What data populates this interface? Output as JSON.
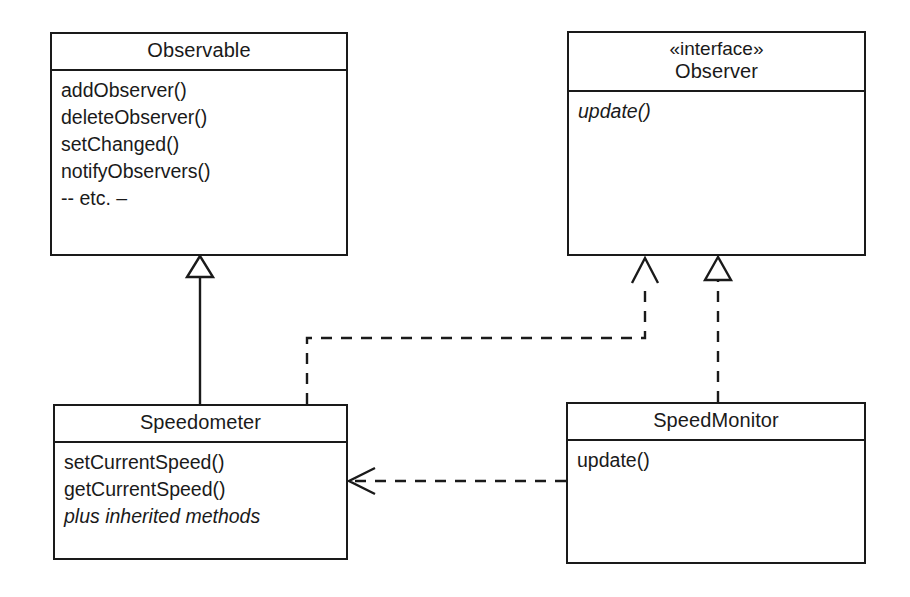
{
  "diagram": {
    "stroke_color": "#1a1a1a",
    "background_color": "#ffffff"
  },
  "classes": {
    "observable": {
      "name": "Observable",
      "stereotype": "",
      "members": [
        "addObserver()",
        "deleteObserver()",
        "setChanged()",
        "notifyObservers()",
        "-- etc. –"
      ]
    },
    "observer": {
      "name": "Observer",
      "stereotype": "«interface»",
      "members": [
        "update()"
      ]
    },
    "speedometer": {
      "name": "Speedometer",
      "stereotype": "",
      "members": [
        "setCurrentSpeed()",
        "getCurrentSpeed()",
        "plus inherited methods"
      ]
    },
    "speedmonitor": {
      "name": "SpeedMonitor",
      "stereotype": "",
      "members": [
        "update()"
      ]
    }
  },
  "relationships": [
    {
      "id": "generalization-speedometer-observable",
      "kind": "generalization",
      "line_style": "solid",
      "arrowhead": "hollow-closed-triangle",
      "from": "Speedometer",
      "to": "Observable"
    },
    {
      "id": "realization-speedometer-observer",
      "kind": "realization",
      "line_style": "dashed",
      "arrowhead": "open-v-arrow",
      "from": "Speedometer",
      "to": "Observer"
    },
    {
      "id": "realization-speedmonitor-observer",
      "kind": "realization",
      "line_style": "dashed",
      "arrowhead": "hollow-closed-triangle",
      "from": "SpeedMonitor",
      "to": "Observer"
    },
    {
      "id": "dependency-speedmonitor-speedometer",
      "kind": "dependency",
      "line_style": "dashed",
      "arrowhead": "open-v-arrow",
      "from": "SpeedMonitor",
      "to": "Speedometer"
    }
  ]
}
